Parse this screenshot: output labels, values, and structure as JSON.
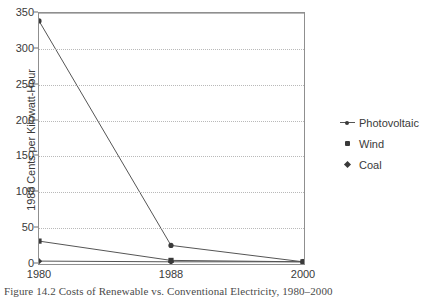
{
  "figure": {
    "caption": "Figure 14.2   Costs of Renewable vs. Conventional Electricity, 1980–2000"
  },
  "chart_data": {
    "type": "line",
    "title": "",
    "xlabel": "",
    "ylabel": "1988 Cents per Kilowatt-Hour",
    "x": [
      "1980",
      "1988",
      "2000"
    ],
    "categories": [
      "1980",
      "1988",
      "2000"
    ],
    "series": [
      {
        "name": "Photovoltaic",
        "values": [
          339,
          26,
          3
        ],
        "marker": "dot-line"
      },
      {
        "name": "Wind",
        "values": [
          32,
          5,
          3
        ],
        "marker": "square"
      },
      {
        "name": "Coal",
        "values": [
          4,
          3,
          3
        ],
        "marker": "diamond"
      }
    ],
    "ylim": [
      0,
      350
    ],
    "xlim": [
      "1980",
      "2000"
    ],
    "y_ticks": [
      0,
      50,
      100,
      150,
      200,
      250,
      300,
      350
    ],
    "y_tick_labels": [
      "0",
      "50",
      "100",
      "150",
      "200",
      "250",
      "300",
      "350"
    ],
    "x_tick_labels": [
      "1980",
      "1988",
      "2000"
    ],
    "grid": "horizontal-dotted",
    "legend_position": "right",
    "legend_entries": [
      "Photovoltaic",
      "Wind",
      "Coal"
    ],
    "colors": {
      "line": "#555555",
      "marker": "#3a3a3a",
      "grid": "#b9b9b9",
      "axis": "#8f8f8f",
      "text": "#3a3a3a",
      "background": "#ffffff"
    }
  }
}
